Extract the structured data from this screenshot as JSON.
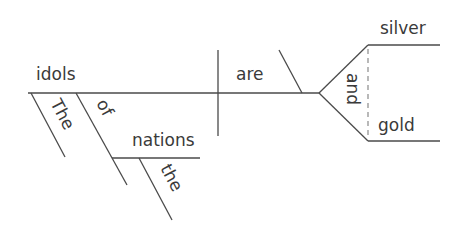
{
  "diagram": {
    "type": "sentence-diagram",
    "sentence": "The idols of the nations are silver and gold",
    "subject": "idols",
    "verb": "are",
    "conjunction": "and",
    "complements": [
      "silver",
      "gold"
    ],
    "modifiers": {
      "article_subject": "The",
      "preposition": "of",
      "prep_object": "nations",
      "article_object": "the"
    },
    "colors": {
      "line": "#4a4a4a",
      "text": "#3a3a3a",
      "dashed": "#8a8a8a",
      "background": "#ffffff"
    }
  }
}
